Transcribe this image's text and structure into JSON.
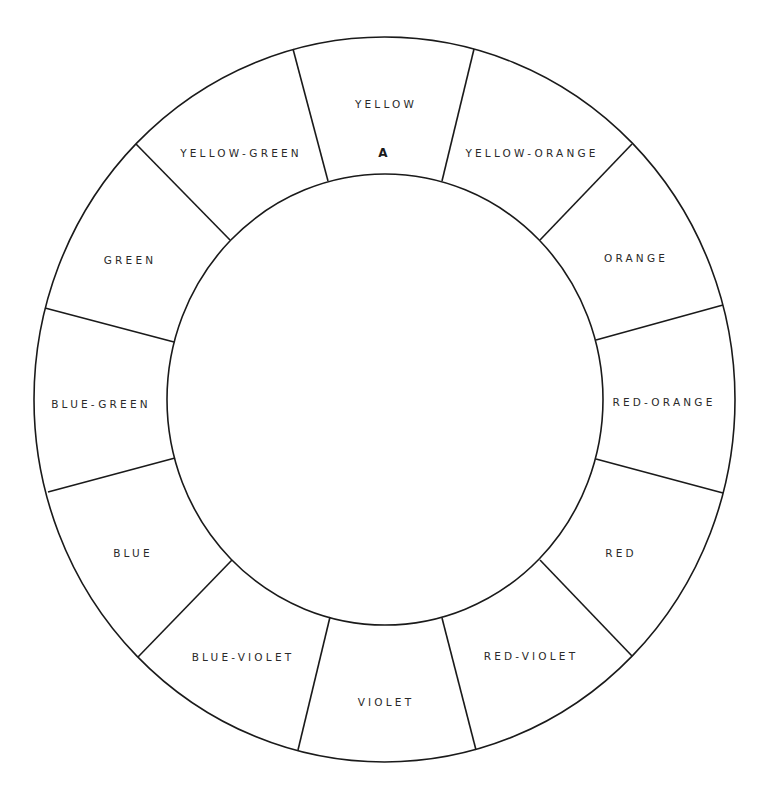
{
  "diagram": {
    "stroke_color": "#1a1a1a",
    "background": "#ffffff",
    "outer_ring": {
      "cx": 384.5,
      "cy": 399.5,
      "rx": 350.5,
      "ry": 362.5
    },
    "inner_circle": {
      "cx": 385,
      "cy": 399.5,
      "rx": 218,
      "ry": 225.5
    },
    "marker": {
      "text": "A",
      "x": 383,
      "y": 153
    },
    "segments": [
      {
        "label": "YELLOW",
        "x": 386,
        "y": 104
      },
      {
        "label": "YELLOW-ORANGE",
        "x": 532,
        "y": 153
      },
      {
        "label": "ORANGE",
        "x": 636,
        "y": 258
      },
      {
        "label": "RED-ORANGE",
        "x": 664,
        "y": 402
      },
      {
        "label": "RED",
        "x": 621,
        "y": 553
      },
      {
        "label": "RED-VIOLET",
        "x": 531,
        "y": 656
      },
      {
        "label": "VIOLET",
        "x": 386,
        "y": 702
      },
      {
        "label": "BLUE-VIOLET",
        "x": 243,
        "y": 657
      },
      {
        "label": "BLUE",
        "x": 133,
        "y": 553
      },
      {
        "label": "BLUE-GREEN",
        "x": 101,
        "y": 404
      },
      {
        "label": "GREEN",
        "x": 130,
        "y": 260
      },
      {
        "label": "YELLOW-GREEN",
        "x": 241,
        "y": 153
      }
    ],
    "dividers": [
      {
        "x1": 293,
        "y1": 49,
        "x2": 328,
        "y2": 181
      },
      {
        "x1": 474,
        "y1": 49,
        "x2": 442,
        "y2": 181
      },
      {
        "x1": 136,
        "y1": 144,
        "x2": 230,
        "y2": 240
      },
      {
        "x1": 632,
        "y1": 144,
        "x2": 540,
        "y2": 240
      },
      {
        "x1": 45,
        "y1": 308,
        "x2": 174,
        "y2": 342
      },
      {
        "x1": 723,
        "y1": 305,
        "x2": 596,
        "y2": 340
      },
      {
        "x1": 48,
        "y1": 492,
        "x2": 175,
        "y2": 458
      },
      {
        "x1": 723,
        "y1": 493,
        "x2": 596,
        "y2": 459
      },
      {
        "x1": 138,
        "y1": 657,
        "x2": 232,
        "y2": 560
      },
      {
        "x1": 632,
        "y1": 656,
        "x2": 540,
        "y2": 560
      },
      {
        "x1": 298,
        "y1": 750,
        "x2": 330,
        "y2": 617
      },
      {
        "x1": 476,
        "y1": 750,
        "x2": 442,
        "y2": 618
      }
    ]
  }
}
